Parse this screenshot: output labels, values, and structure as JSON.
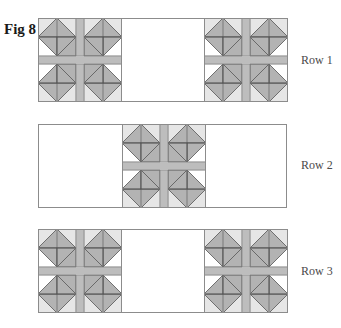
{
  "figure": {
    "title": "Fig 8",
    "colors": {
      "background": "#ffffff",
      "outline": "#8c8c8c",
      "triangle_fill": "#b3b3b3",
      "sashing_fill": "#bdbdbd",
      "light_fill": "#e6e6e6",
      "line": "#555555"
    },
    "rows": [
      {
        "label": "Row 1",
        "blocks": [
          "left",
          "right"
        ]
      },
      {
        "label": "Row 2",
        "blocks": [
          "center"
        ]
      },
      {
        "label": "Row 3",
        "blocks": [
          "left",
          "right"
        ]
      }
    ]
  }
}
